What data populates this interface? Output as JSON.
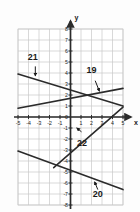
{
  "figure": {
    "type": "coordinate-grid",
    "background": "#ffffff",
    "grid_color": "#c9c9c9",
    "axis_color": "#2b2b2b",
    "line_color": "#2b2b2b",
    "label_color": "#1a1a1a"
  },
  "axes": {
    "x_label": "x",
    "y_label": "y",
    "x_min": -5,
    "x_max": 5,
    "y_min": -8,
    "y_max": 8,
    "x_ticks": [
      {
        "value": -5,
        "label": "-5"
      },
      {
        "value": -4,
        "label": "-4"
      },
      {
        "value": -3,
        "label": "-3"
      },
      {
        "value": -2,
        "label": "-2"
      },
      {
        "value": -1,
        "label": "-1"
      },
      {
        "value": 1,
        "label": "1"
      },
      {
        "value": 2,
        "label": "2"
      },
      {
        "value": 3,
        "label": "3"
      },
      {
        "value": 4,
        "label": "4"
      },
      {
        "value": 5,
        "label": "5"
      }
    ],
    "y_ticks": [
      {
        "value": 8,
        "label": "8"
      },
      {
        "value": 7,
        "label": "7"
      },
      {
        "value": 6,
        "label": "6"
      },
      {
        "value": 5,
        "label": "5"
      },
      {
        "value": 4,
        "label": "4"
      },
      {
        "value": 3,
        "label": "3"
      },
      {
        "value": 2,
        "label": "2"
      },
      {
        "value": 1,
        "label": "1"
      },
      {
        "value": 0,
        "label": "0"
      },
      {
        "value": -1,
        "label": "-1"
      },
      {
        "value": -2,
        "label": "-2"
      },
      {
        "value": -3,
        "label": "-3"
      },
      {
        "value": -4,
        "label": "-4"
      },
      {
        "value": -5,
        "label": "-5"
      },
      {
        "value": -6,
        "label": "-6"
      },
      {
        "value": -7,
        "label": "-7"
      },
      {
        "value": -8,
        "label": "-8"
      }
    ]
  },
  "lines": [
    {
      "id": "19",
      "label": "19",
      "x1": -5,
      "y1": 0.8,
      "x2": 5,
      "y2": 2.6,
      "label_x": 2.0,
      "label_y": 4.0,
      "pointer_from_x": 2.35,
      "pointer_from_y": 3.3,
      "pointer_to_x": 2.75,
      "pointer_to_y": 2.35
    },
    {
      "id": "20",
      "label": "20",
      "x1": -5,
      "y1": -3.1,
      "x2": 5,
      "y2": -6.6,
      "label_x": 2.6,
      "label_y": -7.3,
      "pointer_from_x": 2.6,
      "pointer_from_y": -6.6,
      "pointer_to_x": 2.3,
      "pointer_to_y": -5.9
    },
    {
      "id": "21",
      "label": "21",
      "x1": -5,
      "y1": 3.9,
      "x2": 5,
      "y2": 1.0,
      "label_x": -3.6,
      "label_y": 5.2,
      "pointer_from_x": -3.35,
      "pointer_from_y": 4.6,
      "pointer_to_x": -3.35,
      "pointer_to_y": 3.75
    },
    {
      "id": "22",
      "label": "22",
      "x1": -1.6,
      "y1": -4.6,
      "x2": 5,
      "y2": 0.9,
      "label_x": 1.1,
      "label_y": -2.6,
      "pointer_from_x": 1.05,
      "pointer_from_y": -1.35,
      "pointer_to_x": 0.6,
      "pointer_to_y": -1.0
    }
  ]
}
